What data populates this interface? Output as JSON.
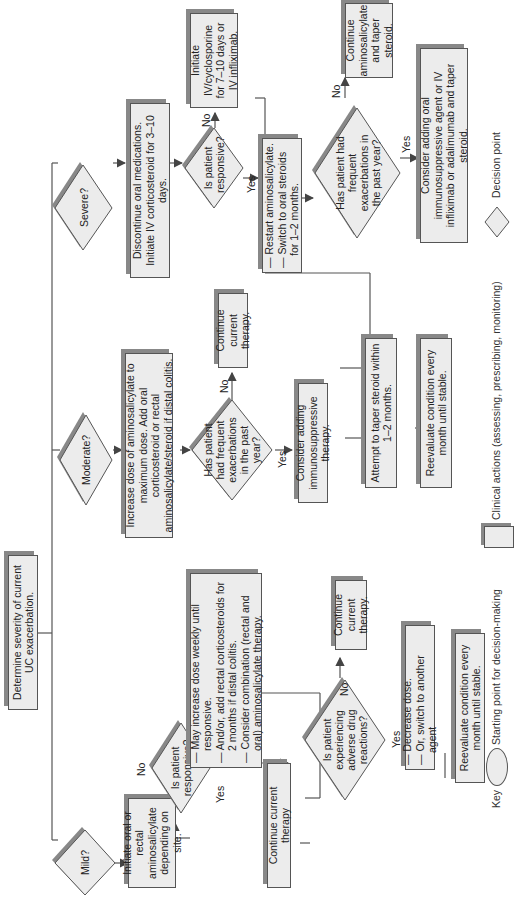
{
  "start": {
    "text": "Determine severity of current UC exacerbation."
  },
  "mild": {
    "question": "Mild?",
    "initiate": "Initiate oral or rectal aminosalicylate depending on site.",
    "responsive_q": "Is patient responsive?",
    "no_label": "No",
    "yes_label": "Yes",
    "no_actions": [
      "May increase dose weekly until responsive.",
      "And/or, add rectal corticosteroids for 2 months if distal colitis.",
      "Consider combination (rectal and oral) aminosalicylate therapy."
    ],
    "continue": "Continue current therapy",
    "adverse_q": "Is patient experiencing adverse drug reactions?",
    "adverse_no": "No",
    "adverse_yes": "Yes",
    "adverse_no_action": "Continue current therapy.",
    "adverse_yes_actions": [
      "Decrease dose.",
      "Or, switch to another agent"
    ],
    "reevaluate": "Reevaluate condition every month until stable."
  },
  "moderate": {
    "question": "Moderate?",
    "increase": "Increase dose of aminosalicylate to maximum dose. Add oral corticosteroid or rectal aminosalicylate/steroid if distal colitis.",
    "frequent_q": "Has patient had frequent exacerbations in the past year?",
    "no_label": "No",
    "yes_label": "Yes",
    "no_action": "Continue current therapy.",
    "yes_action": "Consider adding immunosuppressive therapy.",
    "taper": "Attempt to taper steroid within 1–2 months.",
    "reevaluate": "Reevaluate condition every month until stable."
  },
  "severe": {
    "question": "Severe?",
    "discontinue": "Discontinue oral medications. Initiate IV corticosteroid for 3–10 days.",
    "responsive_q": "Is patient responsive?",
    "no_label": "No",
    "yes_label": "Yes",
    "no_action": "Initiate IV/cyclosporine for 7–10 days or IV infliximab.",
    "yes_actions": [
      "Restart aminosalicylate.",
      "Switch to oral steroids for 1–2 months."
    ],
    "frequent_q": "Has patient had frequent exacerbations in the past year?",
    "freq_no": "No",
    "freq_yes": "Yes",
    "freq_no_action": "Continue aminosalicylate and taper steroid.",
    "freq_yes_action": "Consider adding oral immunosuppressive agent or IV infliximab or adalimumab and taper steroid."
  },
  "key": {
    "title": "Key",
    "start_label": "Starting point for decision-making",
    "action_label": "Clinical actions (assessing, prescribing, monitoring)",
    "decision_label": "Decision point"
  }
}
